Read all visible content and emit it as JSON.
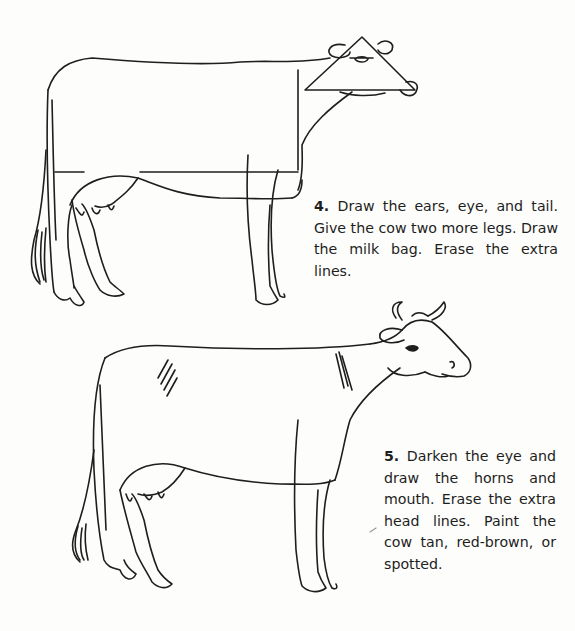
{
  "steps": [
    {
      "number": "4.",
      "text": "Draw the ears, eye, and tail. Give the cow two more legs. Draw the milk bag. Erase the extra lines."
    },
    {
      "number": "5.",
      "text": "Darken the eye and draw the horns and mouth. Erase the extra head lines. Paint the cow tan, red-brown, or spotted."
    }
  ],
  "illustrations": [
    {
      "name": "cow-step-4",
      "description": "Cow outline with guide lines, triangular head, ears, tail and milk bag"
    },
    {
      "name": "cow-step-5",
      "description": "Finished cow outline with horns, eye, mouth and shading"
    }
  ],
  "colors": {
    "ink": "#1e1e1e",
    "paper": "#fdfdfb"
  }
}
